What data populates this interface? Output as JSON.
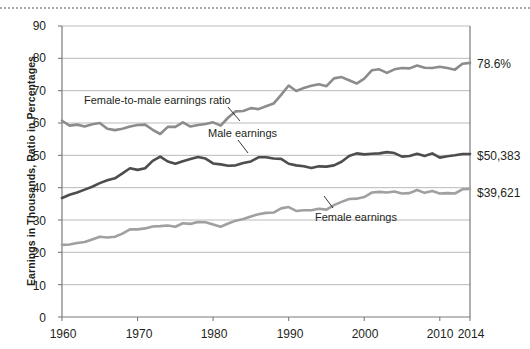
{
  "chart_data": {
    "type": "line",
    "title": "",
    "xlabel": "",
    "ylabel": "Earnings in Thousands, Ratio in Percentages",
    "xlim": [
      1960,
      2014
    ],
    "ylim": [
      0,
      90
    ],
    "grid": true,
    "legend_position": "inline-annotations",
    "ytick_labels": [
      "0",
      "10",
      "20",
      "30",
      "40",
      "50",
      "60",
      "70",
      "80",
      "90"
    ],
    "yticks": [
      0,
      10,
      20,
      30,
      40,
      50,
      60,
      70,
      80,
      90
    ],
    "xtick_labels": [
      "1960",
      "1970",
      "1980",
      "1990",
      "2000",
      "2010",
      "2014"
    ],
    "xticks": [
      1960,
      1970,
      1980,
      1990,
      2000,
      2010,
      2014
    ],
    "x": [
      1960,
      1961,
      1962,
      1963,
      1964,
      1965,
      1966,
      1967,
      1968,
      1969,
      1970,
      1971,
      1972,
      1973,
      1974,
      1975,
      1976,
      1977,
      1978,
      1979,
      1980,
      1981,
      1982,
      1983,
      1984,
      1985,
      1986,
      1987,
      1988,
      1989,
      1990,
      1991,
      1992,
      1993,
      1994,
      1995,
      1996,
      1997,
      1998,
      1999,
      2000,
      2001,
      2002,
      2003,
      2004,
      2005,
      2006,
      2007,
      2008,
      2009,
      2010,
      2011,
      2012,
      2013,
      2014
    ],
    "series": [
      {
        "name": "Female-to-male earnings ratio",
        "unit": "percent",
        "color": "#8c8c8c",
        "end_label": "78.6%",
        "values": [
          60.7,
          59.2,
          59.5,
          58.9,
          59.6,
          60.0,
          58.2,
          57.8,
          58.2,
          58.9,
          59.4,
          59.5,
          57.9,
          56.6,
          58.8,
          58.8,
          60.2,
          58.9,
          59.4,
          59.7,
          60.2,
          59.2,
          61.7,
          63.6,
          63.7,
          64.6,
          64.3,
          65.2,
          66.0,
          68.7,
          71.6,
          69.9,
          70.8,
          71.5,
          72.0,
          71.4,
          73.8,
          74.2,
          73.2,
          72.2,
          73.7,
          76.3,
          76.6,
          75.5,
          76.6,
          77.0,
          76.9,
          77.8,
          77.1,
          77.0,
          77.4,
          77.0,
          76.5,
          78.3,
          78.6
        ]
      },
      {
        "name": "Male earnings",
        "unit": "thousands of dollars",
        "color": "#4d4d4d",
        "end_label": "$50,383",
        "values": [
          36.8,
          37.8,
          38.5,
          39.4,
          40.3,
          41.4,
          42.3,
          42.9,
          44.4,
          46.0,
          45.5,
          46.0,
          48.3,
          49.6,
          48.1,
          47.4,
          48.2,
          48.9,
          49.5,
          49.0,
          47.5,
          47.2,
          46.8,
          46.9,
          47.6,
          48.1,
          49.4,
          49.4,
          49.0,
          48.9,
          47.4,
          46.9,
          46.6,
          46.1,
          46.6,
          46.5,
          46.9,
          48.0,
          49.8,
          50.6,
          50.3,
          50.5,
          50.6,
          51.0,
          50.7,
          49.6,
          49.8,
          50.5,
          49.8,
          50.6,
          49.3,
          49.7,
          50.0,
          50.4,
          50.4
        ]
      },
      {
        "name": "Female earnings",
        "unit": "thousands of dollars",
        "color": "#a0a0a0",
        "end_label": "$39,621",
        "values": [
          22.3,
          22.4,
          22.9,
          23.2,
          24.0,
          24.8,
          24.6,
          24.8,
          25.8,
          27.1,
          27.1,
          27.4,
          28.0,
          28.1,
          28.3,
          27.9,
          29.0,
          28.8,
          29.4,
          29.3,
          28.6,
          27.9,
          28.9,
          29.8,
          30.3,
          31.1,
          31.8,
          32.2,
          32.3,
          33.6,
          34.0,
          32.8,
          33.0,
          33.0,
          33.5,
          33.2,
          34.6,
          35.6,
          36.5,
          36.6,
          37.1,
          38.5,
          38.7,
          38.5,
          38.8,
          38.2,
          38.3,
          39.3,
          38.4,
          39.0,
          38.2,
          38.3,
          38.2,
          39.5,
          39.6
        ]
      }
    ],
    "annotations": [
      {
        "text": "Female-to-male earnings ratio",
        "series": "Female-to-male earnings ratio"
      },
      {
        "text": "Male earnings",
        "series": "Male earnings"
      },
      {
        "text": "Female earnings",
        "series": "Female earnings"
      }
    ]
  },
  "axis": {
    "y_title": "Earnings in Thousands, Ratio in Percentages"
  },
  "labels": {
    "y0": "0",
    "y10": "10",
    "y20": "20",
    "y30": "30",
    "y40": "40",
    "y50": "50",
    "y60": "60",
    "y70": "70",
    "y80": "80",
    "y90": "90",
    "x1960": "1960",
    "x1970": "1970",
    "x1980": "1980",
    "x1990": "1990",
    "x2000": "2000",
    "x2010": "2010",
    "x2014": "2014",
    "ratio_end": "78.6%",
    "male_end": "$50,383",
    "female_end": "$39,621",
    "ratio_series": "Female-to-male earnings ratio",
    "male_series": "Male earnings",
    "female_series": "Female earnings"
  }
}
